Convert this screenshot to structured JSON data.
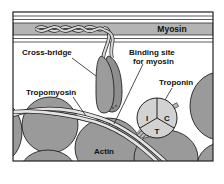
{
  "diagram": {
    "labels": {
      "myosin": "Myosin",
      "cross_bridge": "Cross-bridge",
      "binding_site_line1": "Binding site",
      "binding_site_line2": "for myosin",
      "troponin": "Troponin",
      "tropomyosin": "Tropomyosin",
      "actin": "Actin"
    },
    "troponin_subunits": {
      "i": "I",
      "c": "C",
      "t": "T"
    },
    "colors": {
      "frame": "#222222",
      "myosin_band": "#b4b4b4",
      "actin": "#9a9a9a",
      "cross_bridge_head": "#9c9c9c",
      "troponin": "#d2d2d2",
      "tropomyosin": "#e4e4e4",
      "background": "#ffffff"
    }
  }
}
